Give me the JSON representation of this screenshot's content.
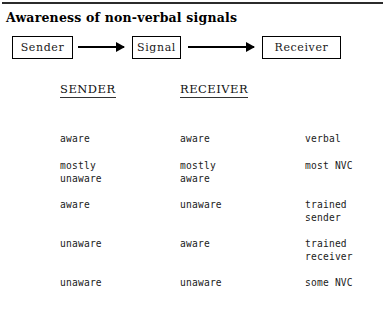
{
  "document": {
    "title": "Awareness of non-verbal signals",
    "top_rule": true
  },
  "flow_diagram": {
    "nodes": [
      {
        "id": "sender",
        "label": "Sender"
      },
      {
        "id": "signal",
        "label": "Signal"
      },
      {
        "id": "receiver",
        "label": "Receiver"
      }
    ],
    "arrows": [
      {
        "id": "arrow-1",
        "from": "sender",
        "to": "signal"
      },
      {
        "id": "arrow-2",
        "from": "signal",
        "to": "receiver"
      }
    ]
  },
  "table": {
    "headers": [
      "SENDER",
      "RECEIVER",
      ""
    ],
    "rows": [
      {
        "sender": "aware",
        "receiver": "aware",
        "result": "verbal"
      },
      {
        "sender": "mostly\nunaware",
        "receiver": "mostly\naware",
        "result": "most NVC"
      },
      {
        "sender": "aware",
        "receiver": "unaware",
        "result": "trained\nsender"
      },
      {
        "sender": "unaware",
        "receiver": "aware",
        "result": "trained\nreceiver"
      },
      {
        "sender": "unaware",
        "receiver": "unaware",
        "result": "some NVC"
      }
    ]
  }
}
